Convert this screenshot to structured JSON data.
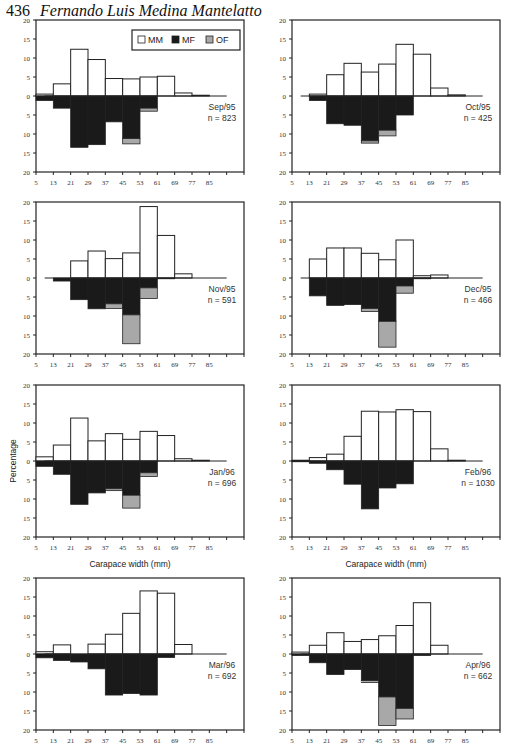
{
  "header": {
    "page_number": "436",
    "author": "Fernando Luis Medina Mantelatto"
  },
  "legend": [
    {
      "label": "MM",
      "color": "#ffffff"
    },
    {
      "label": "MF",
      "color": "#1a1a1a"
    },
    {
      "label": "OF",
      "color": "#a8a8a8"
    }
  ],
  "axis": {
    "ylabel": "Percentage",
    "xlabel": "Carapace width (mm)",
    "yticks": [
      "20",
      "15",
      "10",
      "5",
      "0",
      "5",
      "10",
      "15",
      "20"
    ],
    "xticks": [
      "5",
      "13",
      "21",
      "29",
      "37",
      "45",
      "53",
      "61",
      "69",
      "77",
      "85"
    ]
  },
  "chart_data": [
    {
      "type": "bar",
      "title": "Sep/95",
      "n": "n = 823",
      "categories": [
        9,
        17,
        25,
        33,
        41,
        49,
        57,
        65,
        73,
        81,
        89
      ],
      "series": [
        {
          "name": "MM",
          "values": [
            0.5,
            3.2,
            12.3,
            9.6,
            4.6,
            4.5,
            5.0,
            5.2,
            0.8,
            0.2,
            0
          ]
        },
        {
          "name": "MF",
          "values": [
            1.2,
            3.2,
            13.5,
            12.8,
            6.8,
            11.2,
            3.2,
            0,
            0,
            0,
            0
          ]
        },
        {
          "name": "OF",
          "values": [
            0,
            0,
            0,
            0,
            0,
            1.4,
            0.8,
            0,
            0,
            0,
            0
          ]
        }
      ]
    },
    {
      "type": "bar",
      "title": "Oct/95",
      "n": "n = 425",
      "categories": [
        9,
        17,
        25,
        33,
        41,
        49,
        57,
        65,
        73,
        81,
        89
      ],
      "series": [
        {
          "name": "MM",
          "values": [
            0,
            0.5,
            5.6,
            8.6,
            6.3,
            8.4,
            13.6,
            11.0,
            2.1,
            0.3,
            0
          ]
        },
        {
          "name": "MF",
          "values": [
            0,
            1.2,
            7.3,
            7.7,
            11.8,
            9.0,
            5.0,
            0,
            0,
            0,
            0
          ]
        },
        {
          "name": "OF",
          "values": [
            0,
            0,
            0,
            0,
            0.6,
            1.5,
            0,
            0,
            0,
            0,
            0
          ]
        }
      ]
    },
    {
      "type": "bar",
      "title": "Nov/95",
      "n": "n = 591",
      "categories": [
        9,
        17,
        25,
        33,
        41,
        49,
        57,
        65,
        73,
        81,
        89
      ],
      "series": [
        {
          "name": "MM",
          "values": [
            0,
            0,
            4.5,
            7.1,
            5.1,
            6.6,
            18.8,
            11.2,
            1.1,
            0,
            0
          ]
        },
        {
          "name": "MF",
          "values": [
            0,
            0.8,
            5.7,
            8.1,
            6.8,
            9.7,
            2.6,
            0.2,
            0,
            0,
            0
          ]
        },
        {
          "name": "OF",
          "values": [
            0,
            0,
            0,
            0,
            1.2,
            7.6,
            2.8,
            0,
            0,
            0,
            0
          ]
        }
      ]
    },
    {
      "type": "bar",
      "title": "Dec/95",
      "n": "n = 466",
      "categories": [
        9,
        17,
        25,
        33,
        41,
        49,
        57,
        65,
        73,
        81,
        89
      ],
      "series": [
        {
          "name": "MM",
          "values": [
            0,
            5.0,
            7.9,
            7.9,
            6.5,
            4.8,
            10.0,
            0.6,
            0.8,
            0,
            0
          ]
        },
        {
          "name": "MF",
          "values": [
            0,
            4.7,
            7.2,
            7.0,
            8.0,
            11.4,
            2.1,
            0.2,
            0,
            0,
            0
          ]
        },
        {
          "name": "OF",
          "values": [
            0,
            0,
            0,
            0,
            0.8,
            6.8,
            1.9,
            0,
            0,
            0,
            0
          ]
        }
      ]
    },
    {
      "type": "bar",
      "title": "Jan/96",
      "n": "n = 696",
      "categories": [
        9,
        17,
        25,
        33,
        41,
        49,
        57,
        65,
        73,
        81,
        89
      ],
      "series": [
        {
          "name": "MM",
          "values": [
            1.1,
            4.2,
            11.3,
            5.3,
            7.2,
            5.7,
            7.8,
            6.7,
            0.6,
            0.2,
            0
          ]
        },
        {
          "name": "MF",
          "values": [
            1.4,
            3.5,
            11.4,
            8.4,
            7.3,
            9.0,
            3.1,
            0,
            0,
            0,
            0
          ]
        },
        {
          "name": "OF",
          "values": [
            0,
            0,
            0,
            0,
            0.5,
            3.4,
            1.0,
            0,
            0,
            0,
            0
          ]
        }
      ]
    },
    {
      "type": "bar",
      "title": "Feb/96",
      "n": "n = 1030",
      "categories": [
        9,
        17,
        25,
        33,
        41,
        49,
        57,
        65,
        73,
        81,
        89
      ],
      "series": [
        {
          "name": "MM",
          "values": [
            0.2,
            0.9,
            1.8,
            6.5,
            13.1,
            12.9,
            13.5,
            13.0,
            3.2,
            0.2,
            0
          ]
        },
        {
          "name": "MF",
          "values": [
            0.2,
            0.6,
            2.3,
            6.1,
            12.6,
            7.1,
            6.0,
            0,
            0,
            0,
            0
          ]
        },
        {
          "name": "OF",
          "values": [
            0,
            0,
            0,
            0,
            0,
            0,
            0,
            0,
            0,
            0,
            0
          ]
        }
      ]
    },
    {
      "type": "bar",
      "title": "Mar/96",
      "n": "n = 692",
      "categories": [
        9,
        17,
        25,
        33,
        41,
        49,
        57,
        65,
        73,
        81,
        89
      ],
      "series": [
        {
          "name": "MM",
          "values": [
            0.6,
            2.4,
            0,
            2.6,
            5.2,
            10.7,
            16.6,
            16.0,
            2.5,
            0,
            0
          ]
        },
        {
          "name": "MF",
          "values": [
            1.0,
            1.7,
            2.1,
            3.9,
            10.8,
            10.4,
            10.8,
            0.9,
            0,
            0,
            0
          ]
        },
        {
          "name": "OF",
          "values": [
            0,
            0,
            0,
            0,
            0,
            0,
            0,
            0,
            0,
            0,
            0
          ]
        }
      ]
    },
    {
      "type": "bar",
      "title": "Apr/96",
      "n": "n = 662",
      "categories": [
        9,
        17,
        25,
        33,
        41,
        49,
        57,
        65,
        73,
        81,
        89
      ],
      "series": [
        {
          "name": "MM",
          "values": [
            0.5,
            2.3,
            5.6,
            3.3,
            3.8,
            4.8,
            7.5,
            13.5,
            2.3,
            0,
            0
          ]
        },
        {
          "name": "MF",
          "values": [
            0.4,
            2.3,
            5.4,
            4.1,
            7.0,
            11.3,
            14.3,
            0.4,
            0,
            0,
            0
          ]
        },
        {
          "name": "OF",
          "values": [
            0,
            0,
            0,
            0,
            0.5,
            7.5,
            2.8,
            0,
            0,
            0,
            0
          ]
        }
      ]
    }
  ]
}
